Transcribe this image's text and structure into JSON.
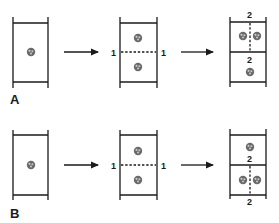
{
  "figure": {
    "rows": [
      {
        "label": "A",
        "steps": [
          {
            "stage": "single-cell",
            "dividers": []
          },
          {
            "stage": "first-division",
            "division_label_left": "1",
            "division_label_right": "1",
            "division_orientation": "horizontal"
          },
          {
            "stage": "second-division",
            "top_label": "2",
            "mid_label": "2",
            "top_division": "vertical",
            "bottom_division": "none"
          }
        ]
      },
      {
        "label": "B",
        "steps": [
          {
            "stage": "single-cell",
            "dividers": []
          },
          {
            "stage": "first-division",
            "division_label_left": "1",
            "division_label_right": "1",
            "division_orientation": "horizontal"
          },
          {
            "stage": "second-division",
            "mid_label": "2",
            "bottom_label": "2",
            "top_division": "none",
            "bottom_division": "vertical"
          }
        ]
      }
    ],
    "colors": {
      "ink": "#1a1a1a",
      "blob": "#6a6a6a",
      "background": "#ffffff"
    }
  }
}
